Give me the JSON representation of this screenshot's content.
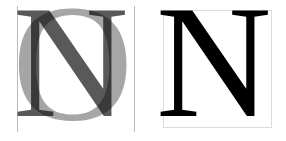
{
  "figure": {
    "type": "typography-comparison",
    "background_color": "#ffffff",
    "width": 286,
    "height": 141
  },
  "panels": [
    {
      "id": "overlay",
      "name": "overlaid-glyphs-panel",
      "description": "Capital N superimposed over capital O",
      "glyphs": [
        {
          "character": "O",
          "role": "background-glyph",
          "color": "#a6a6a6",
          "typeface_style": "serif"
        },
        {
          "character": "N",
          "role": "foreground-glyph",
          "color": "#595959",
          "typeface_style": "serif"
        }
      ],
      "guides": {
        "count": 2,
        "color": "#b9b9b9",
        "orientation": "vertical",
        "label": "sidebearing-guides"
      }
    },
    {
      "id": "solo",
      "name": "single-glyph-panel",
      "description": "Capital N inside its em box",
      "glyphs": [
        {
          "character": "N",
          "role": "foreground-glyph",
          "color": "#000000",
          "typeface_style": "serif"
        }
      ],
      "box": {
        "label": "em-box",
        "border_color": "#dcdcdc",
        "fill_color": "#ffffff"
      }
    }
  ]
}
